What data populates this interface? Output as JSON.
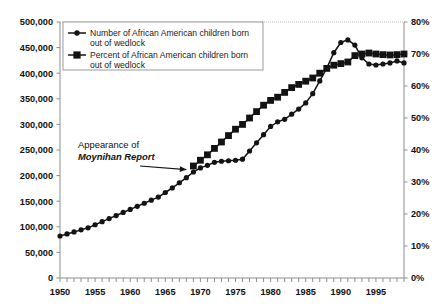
{
  "chart_data": {
    "type": "line",
    "title": "",
    "xlabel": "",
    "ylabel": "",
    "grid": false,
    "legend_position": "top-left",
    "x": [
      1950,
      1951,
      1952,
      1953,
      1954,
      1955,
      1956,
      1957,
      1958,
      1959,
      1960,
      1961,
      1962,
      1963,
      1964,
      1965,
      1966,
      1967,
      1968,
      1969,
      1970,
      1971,
      1972,
      1973,
      1974,
      1975,
      1976,
      1977,
      1978,
      1979,
      1980,
      1981,
      1982,
      1983,
      1984,
      1985,
      1986,
      1987,
      1988,
      1989,
      1990,
      1991,
      1992,
      1993,
      1994,
      1995,
      1996,
      1997,
      1998,
      1999
    ],
    "xtick_labels": [
      "1950",
      "1955",
      "1960",
      "1965",
      "1970",
      "1975",
      "1980",
      "1985",
      "1990",
      "1995"
    ],
    "xtick_values": [
      1950,
      1955,
      1960,
      1965,
      1970,
      1975,
      1980,
      1985,
      1990,
      1995
    ],
    "left_axis": {
      "label": "",
      "ylim": [
        0,
        500000
      ],
      "ticks": [
        0,
        50000,
        100000,
        150000,
        200000,
        250000,
        300000,
        350000,
        400000,
        450000,
        500000
      ],
      "tick_labels": [
        "0",
        "50,000",
        "100,000",
        "150,000",
        "200,000",
        "250,000",
        "300,000",
        "350,000",
        "400,000",
        "450,000",
        "500,000"
      ]
    },
    "right_axis": {
      "label": "",
      "ylim": [
        0,
        80
      ],
      "ticks": [
        0,
        10,
        20,
        30,
        40,
        50,
        60,
        70,
        80
      ],
      "tick_labels": [
        "0%",
        "10%",
        "20%",
        "30%",
        "40%",
        "50%",
        "60%",
        "70%",
        "80%"
      ]
    },
    "series": [
      {
        "name": "Number of African American children born out of wedlock",
        "axis": "left",
        "marker": "circle",
        "x": [
          1950,
          1951,
          1952,
          1953,
          1954,
          1955,
          1956,
          1957,
          1958,
          1959,
          1960,
          1961,
          1962,
          1963,
          1964,
          1965,
          1966,
          1967,
          1968,
          1969,
          1970,
          1971,
          1972,
          1973,
          1974,
          1975,
          1976,
          1977,
          1978,
          1979,
          1980,
          1981,
          1982,
          1983,
          1984,
          1985,
          1986,
          1987,
          1988,
          1989,
          1990,
          1991,
          1992,
          1993,
          1994,
          1995,
          1996,
          1997,
          1998,
          1999
        ],
        "values": [
          82000,
          86000,
          90000,
          94000,
          98000,
          104000,
          110000,
          116000,
          122000,
          128000,
          134000,
          140000,
          146000,
          152000,
          158000,
          167000,
          176000,
          186000,
          196000,
          207000,
          215000,
          220000,
          226000,
          228000,
          229000,
          230000,
          232000,
          248000,
          264000,
          280000,
          296000,
          305000,
          310000,
          320000,
          330000,
          342000,
          360000,
          385000,
          410000,
          440000,
          460000,
          465000,
          455000,
          430000,
          418000,
          416000,
          418000,
          420000,
          424000,
          420000
        ],
        "ylim_axis": [
          0,
          500000
        ]
      },
      {
        "name": "Percent of African American children born out of wedlock",
        "axis": "right",
        "marker": "square",
        "x": [
          1969,
          1970,
          1971,
          1972,
          1973,
          1974,
          1975,
          1976,
          1977,
          1978,
          1979,
          1980,
          1981,
          1982,
          1983,
          1984,
          1985,
          1986,
          1987,
          1988,
          1989,
          1990,
          1991,
          1992,
          1993,
          1994,
          1995,
          1996,
          1997,
          1998,
          1999
        ],
        "values": [
          35.0,
          36.8,
          38.5,
          40.5,
          42.5,
          44.5,
          46.5,
          48.0,
          50.0,
          52.0,
          54.0,
          55.5,
          56.5,
          58.0,
          59.5,
          60.5,
          61.5,
          62.5,
          64.0,
          65.5,
          66.5,
          67.0,
          67.5,
          69.5,
          70.0,
          70.3,
          70.0,
          69.8,
          69.7,
          69.8,
          70.0
        ],
        "ylim_axis": [
          0,
          80
        ]
      }
    ],
    "annotations": [
      {
        "name": "moynihan-report-annotation",
        "line1": "Appearance of",
        "line2": "Moynihan Report",
        "points_to_x": 1968,
        "points_to_y": 200000
      }
    ]
  },
  "legend": {
    "entries": [
      {
        "marker": "circle-line",
        "line1": "Number of African American children born",
        "line2": "out of wedlock"
      },
      {
        "marker": "square-line",
        "line1": "Percent of African American children born",
        "line2": "out of wedlock"
      }
    ]
  },
  "colors": {
    "series_mark": "#131313",
    "axis": "#8d8d8d",
    "text": "#111111",
    "legend_border": "#9a9a9a",
    "background": "#ffffff"
  }
}
